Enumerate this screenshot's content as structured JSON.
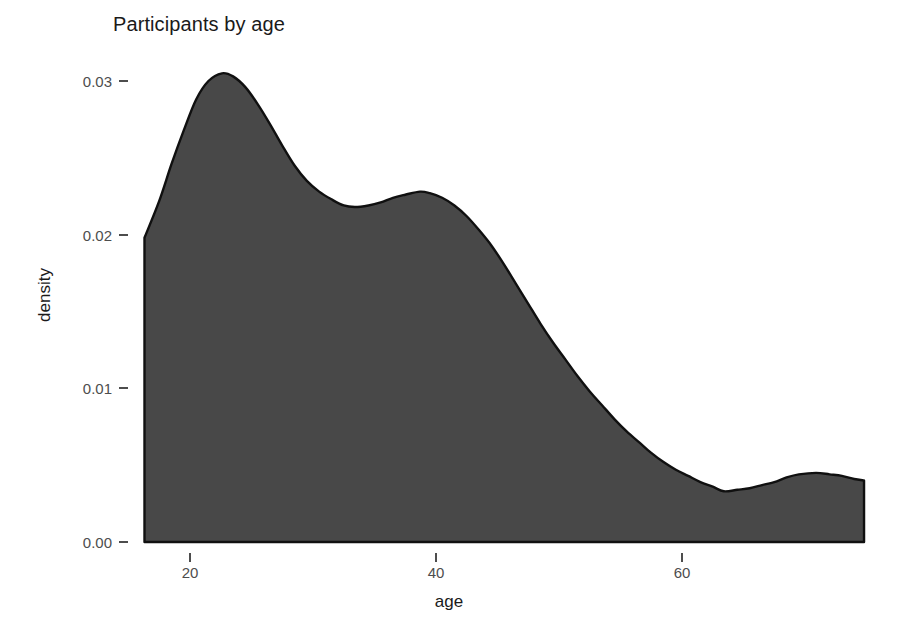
{
  "chart_data": {
    "type": "area",
    "title": "Participants by age",
    "xlabel": "age",
    "ylabel": "density",
    "grid": false,
    "legend": null,
    "xlim": [
      16.3,
      74.8
    ],
    "ylim": [
      0.0,
      0.0325
    ],
    "xticks": [
      20,
      40,
      60
    ],
    "xtick_labels": [
      "20",
      "40",
      "60"
    ],
    "yticks": [
      0.0,
      0.01,
      0.02,
      0.03
    ],
    "ytick_labels": [
      "0.00",
      "0.01",
      "0.02",
      "0.03"
    ],
    "series_name": "density",
    "x": [
      16.3,
      17.5,
      18.5,
      19.5,
      20.5,
      21.5,
      22.6,
      23.5,
      24.5,
      25.5,
      26.5,
      27.5,
      28.5,
      29.5,
      30.5,
      31.5,
      32.5,
      33.4,
      34.5,
      35.5,
      36.5,
      37.5,
      38.7,
      39.5,
      40.5,
      41.5,
      42.5,
      43.5,
      44.5,
      45.5,
      46.5,
      47.5,
      48.5,
      49.5,
      50.5,
      51.5,
      52.5,
      53.5,
      54.5,
      55.5,
      56.5,
      57.5,
      58.5,
      59.5,
      60.5,
      61.5,
      62.5,
      63.4,
      64.5,
      65.5,
      66.5,
      67.5,
      68.5,
      69.5,
      70.9,
      72.0,
      73.0,
      74.0,
      74.8
    ],
    "y": [
      0.0198,
      0.0222,
      0.0246,
      0.0268,
      0.0288,
      0.03,
      0.0305,
      0.0303,
      0.0296,
      0.0285,
      0.0272,
      0.0258,
      0.0245,
      0.0235,
      0.0228,
      0.0223,
      0.0219,
      0.0218,
      0.0219,
      0.0221,
      0.0224,
      0.0226,
      0.0228,
      0.0227,
      0.0224,
      0.0219,
      0.0212,
      0.0203,
      0.0193,
      0.0181,
      0.0168,
      0.0155,
      0.0142,
      0.013,
      0.0119,
      0.0108,
      0.0098,
      0.0089,
      0.008,
      0.0072,
      0.0065,
      0.0058,
      0.0052,
      0.0047,
      0.0043,
      0.0039,
      0.0036,
      0.0033,
      0.0034,
      0.0035,
      0.0037,
      0.0039,
      0.0042,
      0.0044,
      0.0045,
      0.0044,
      0.0043,
      0.0041,
      0.004
    ],
    "colors": {
      "area_fill": "#484848",
      "line_stroke": "#101010",
      "background": "#ffffff",
      "axis_text": "#4d4d4d",
      "label_text": "#1a1a1a"
    }
  },
  "axes": {
    "title": "Participants by age",
    "x_label": "age",
    "y_label": "density"
  }
}
